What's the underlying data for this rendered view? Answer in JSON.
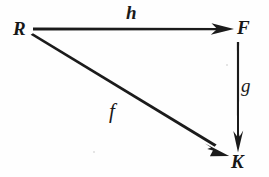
{
  "diagram": {
    "type": "commutative-diagram",
    "title": "",
    "background_color": "#fefefe",
    "ink_color": "#171717",
    "nodes": [
      {
        "id": "R",
        "label": "R",
        "x": 22,
        "y": 29,
        "style": "bold-italic-serif"
      },
      {
        "id": "F",
        "label": "F",
        "x": 245,
        "y": 28,
        "style": "bold-italic-serif"
      },
      {
        "id": "K",
        "label": "K",
        "x": 240,
        "y": 162,
        "style": "bold-italic-serif"
      }
    ],
    "arrows": [
      {
        "id": "h",
        "label": "h",
        "from": "R",
        "to": "F",
        "label_style": "bold-italic-serif",
        "orientation": "horizontal",
        "start": {
          "x": 33,
          "y": 29
        },
        "end": {
          "x": 234,
          "y": 29
        },
        "label_position": {
          "x": 132,
          "y": 12
        }
      },
      {
        "id": "g",
        "label": "g",
        "from": "F",
        "to": "K",
        "label_style": "italic-serif",
        "orientation": "vertical",
        "start": {
          "x": 238,
          "y": 42
        },
        "end": {
          "x": 238,
          "y": 152
        },
        "label_position": {
          "x": 246,
          "y": 86
        }
      },
      {
        "id": "f",
        "label": "f",
        "from": "R",
        "to": "K",
        "label_style": "italic-serif",
        "orientation": "diagonal",
        "start": {
          "x": 31,
          "y": 37
        },
        "end": {
          "x": 229,
          "y": 156
        },
        "label_position": {
          "x": 115,
          "y": 113
        }
      }
    ],
    "artifacts": [
      {
        "name": "scan-speck",
        "x": 93,
        "y": 151
      },
      {
        "name": "scan-speck",
        "x": 226,
        "y": 64
      }
    ]
  }
}
